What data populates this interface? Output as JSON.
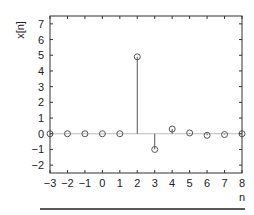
{
  "chart_data": {
    "type": "stem",
    "title": "",
    "xlabel": "n",
    "ylabel": "x[n]",
    "x": [
      -3,
      -2,
      -1,
      0,
      1,
      2,
      3,
      4,
      5,
      6,
      7,
      8
    ],
    "values": [
      0,
      0,
      0,
      0,
      0,
      4.9,
      -1.0,
      0.3,
      0.05,
      -0.1,
      -0.05,
      0
    ],
    "xlim": [
      -3,
      8
    ],
    "ylim": [
      -2.5,
      7.5
    ],
    "xticks": [
      -3,
      -2,
      -1,
      0,
      1,
      2,
      3,
      4,
      5,
      6,
      7,
      8
    ],
    "yticks": [
      -2,
      -1,
      0,
      1,
      2,
      3,
      4,
      5,
      6,
      7
    ],
    "grid": false,
    "legend": null,
    "baseline": 0
  },
  "colors": {
    "axis": "#333333",
    "stem": "#555555",
    "baseline": "#bbbbbb",
    "text": "#222222"
  }
}
